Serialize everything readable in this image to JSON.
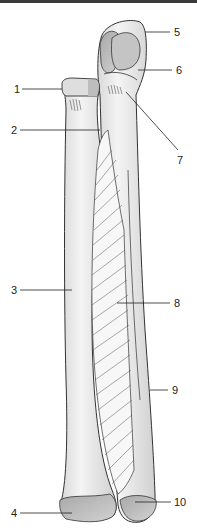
{
  "figure": {
    "colors": {
      "bone_fill": "#ececec",
      "bone_shade": "#d6d6d6",
      "articular_fill": "#bdbdbd",
      "outline": "#333333",
      "membrane_lines": "#555555",
      "leader_line": "#222222"
    },
    "labels": [
      {
        "id": "1",
        "text": "1",
        "x": 14,
        "y": 84,
        "line": {
          "x1": 22,
          "y1": 89,
          "x2": 62,
          "y2": 89
        }
      },
      {
        "id": "2",
        "text": "2",
        "x": 11,
        "y": 125,
        "line": {
          "x1": 20,
          "y1": 130,
          "x2": 100,
          "y2": 130
        }
      },
      {
        "id": "3",
        "text": "3",
        "x": 11,
        "y": 285,
        "line": {
          "x1": 20,
          "y1": 290,
          "x2": 72,
          "y2": 290
        }
      },
      {
        "id": "4",
        "text": "4",
        "x": 11,
        "y": 508,
        "line": {
          "x1": 20,
          "y1": 513,
          "x2": 72,
          "y2": 513
        }
      },
      {
        "id": "5",
        "text": "5",
        "x": 174,
        "y": 27,
        "line": {
          "x1": 145,
          "y1": 32,
          "x2": 170,
          "y2": 32
        }
      },
      {
        "id": "6",
        "text": "6",
        "x": 176,
        "y": 65,
        "line": {
          "x1": 138,
          "y1": 70,
          "x2": 172,
          "y2": 70
        }
      },
      {
        "id": "7",
        "text": "7",
        "x": 177,
        "y": 155,
        "line": {
          "x1": 126,
          "y1": 92,
          "x2": 178,
          "y2": 150
        }
      },
      {
        "id": "8",
        "text": "8",
        "x": 174,
        "y": 298,
        "line": {
          "x1": 117,
          "y1": 303,
          "x2": 170,
          "y2": 303
        }
      },
      {
        "id": "9",
        "text": "9",
        "x": 172,
        "y": 385,
        "line": {
          "x1": 150,
          "y1": 390,
          "x2": 168,
          "y2": 390
        }
      },
      {
        "id": "10",
        "text": "10",
        "x": 174,
        "y": 497,
        "line": {
          "x1": 135,
          "y1": 502,
          "x2": 171,
          "y2": 502
        }
      }
    ]
  }
}
